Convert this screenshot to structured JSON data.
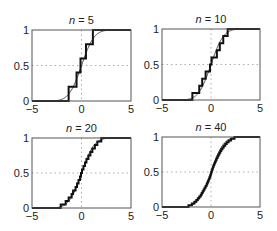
{
  "chart_data": [
    {
      "type": "line",
      "title": "n = 5",
      "n": 5,
      "xlabel": "",
      "ylabel": "",
      "xlim": [
        -5,
        5
      ],
      "ylim": [
        0,
        1
      ],
      "xticks": [
        "-5",
        "0",
        "5"
      ],
      "yticks": [
        "0",
        "0.5",
        "1"
      ],
      "grid": "dotted at x=0 and y=0.5",
      "series": [
        {
          "name": "theoretical CDF (standard normal)",
          "style": "thin"
        },
        {
          "name": "empirical CDF",
          "style": "thick step",
          "samples": [
            -1.3,
            -0.5,
            -0.1,
            0.45,
            1.15
          ]
        }
      ],
      "box": {
        "left": 32,
        "top": 30,
        "right": 131,
        "bottom": 101
      }
    },
    {
      "type": "line",
      "title": "n = 10",
      "n": 10,
      "xlabel": "",
      "ylabel": "",
      "xlim": [
        -5,
        5
      ],
      "ylim": [
        0,
        1
      ],
      "xticks": [
        "-5",
        "0",
        "5"
      ],
      "yticks": [
        "0",
        "0.5",
        "1"
      ],
      "grid": "dotted at x=0 and y=0.5",
      "series": [
        {
          "name": "theoretical CDF (standard normal)",
          "style": "thin"
        },
        {
          "name": "empirical CDF",
          "style": "thick step",
          "samples": [
            -1.9,
            -1.2,
            -0.9,
            -0.55,
            -0.1,
            0.05,
            0.6,
            0.9,
            1.25,
            1.7
          ]
        }
      ],
      "box": {
        "left": 162,
        "top": 29,
        "right": 260,
        "bottom": 100
      }
    },
    {
      "type": "line",
      "title": "n = 20",
      "n": 20,
      "xlabel": "",
      "ylabel": "",
      "xlim": [
        -5,
        5
      ],
      "ylim": [
        0,
        1
      ],
      "xticks": [
        "-5",
        "0",
        "5"
      ],
      "yticks": [
        "0",
        "0.5",
        "1"
      ],
      "grid": "dotted at x=0 and y=0.5",
      "series": [
        {
          "name": "theoretical CDF (standard normal)",
          "style": "thin"
        },
        {
          "name": "empirical CDF",
          "style": "thick step",
          "samples": [
            -2.1,
            -1.6,
            -1.3,
            -1.0,
            -0.85,
            -0.6,
            -0.45,
            -0.3,
            -0.15,
            -0.05,
            0.05,
            0.2,
            0.35,
            0.5,
            0.7,
            0.9,
            1.1,
            1.35,
            1.6,
            2.0
          ]
        }
      ],
      "box": {
        "left": 32,
        "top": 138,
        "right": 131,
        "bottom": 208
      }
    },
    {
      "type": "line",
      "title": "n = 40",
      "n": 40,
      "xlabel": "",
      "ylabel": "",
      "xlim": [
        -5,
        5
      ],
      "ylim": [
        0,
        1
      ],
      "xticks": [
        "-5",
        "0",
        "5"
      ],
      "yticks": [
        "0",
        "0.5",
        "1"
      ],
      "grid": "dotted at x=0 and y=0.5",
      "series": [
        {
          "name": "theoretical CDF (standard normal)",
          "style": "thin"
        },
        {
          "name": "empirical CDF",
          "style": "thick step",
          "samples": [
            -2.3,
            -1.95,
            -1.7,
            -1.5,
            -1.35,
            -1.2,
            -1.05,
            -0.95,
            -0.85,
            -0.75,
            -0.65,
            -0.55,
            -0.45,
            -0.38,
            -0.3,
            -0.22,
            -0.15,
            -0.08,
            -0.02,
            0.03,
            0.08,
            0.14,
            0.2,
            0.27,
            0.34,
            0.42,
            0.5,
            0.58,
            0.67,
            0.76,
            0.85,
            0.95,
            1.05,
            1.17,
            1.3,
            1.45,
            1.6,
            1.8,
            2.05,
            2.4
          ]
        }
      ],
      "box": {
        "left": 162,
        "top": 137,
        "right": 260,
        "bottom": 207
      }
    }
  ]
}
